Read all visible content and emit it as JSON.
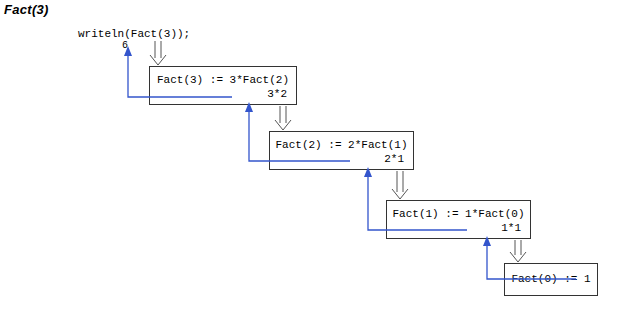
{
  "title": "Fact(3)",
  "call": {
    "statement": "writeln(Fact(3));",
    "result": "6"
  },
  "colors": {
    "return_arrow": "#3355cc",
    "call_arrow": "#555555",
    "box_border": "#333333",
    "text": "#000000",
    "background": "#ffffff"
  },
  "frames": [
    {
      "expression": "Fact(3) := 3*Fact(2)",
      "return_label": "3*2",
      "x": 149,
      "y": 66,
      "w": 148,
      "h": 39
    },
    {
      "expression": "Fact(2) := 2*Fact(1)",
      "return_label": "2*1",
      "x": 269,
      "y": 131,
      "w": 145,
      "h": 39
    },
    {
      "expression": "Fact(1) := 1*Fact(0)",
      "return_label": "1*1",
      "x": 386,
      "y": 200,
      "w": 145,
      "h": 39
    },
    {
      "expression": "Fact(0) := 1",
      "return_label": "",
      "x": 504,
      "y": 263,
      "w": 94,
      "h": 33
    }
  ],
  "call_arrows": [
    {
      "name": "call-arrow-main-to-fact3",
      "x": 158,
      "y1": 41,
      "y2": 64
    },
    {
      "name": "call-arrow-fact3-to-fact2",
      "x": 283,
      "y1": 106,
      "y2": 129
    },
    {
      "name": "call-arrow-fact2-to-fact1",
      "x": 400,
      "y1": 171,
      "y2": 198
    },
    {
      "name": "call-arrow-fact1-to-fact0",
      "x": 518,
      "y1": 240,
      "y2": 261
    }
  ],
  "return_arrows": [
    {
      "name": "return-arrow-fact3-to-main",
      "start_x": 232,
      "y": 97,
      "corner_x": 128,
      "tip_y": 51
    },
    {
      "name": "return-arrow-fact2-to-fact3",
      "start_x": 350,
      "y": 161,
      "corner_x": 249,
      "tip_y": 107
    },
    {
      "name": "return-arrow-fact1-to-fact2",
      "start_x": 467,
      "y": 230,
      "corner_x": 368,
      "tip_y": 172
    },
    {
      "name": "return-arrow-fact0-to-fact1",
      "start_x": 576,
      "y": 279,
      "corner_x": 487,
      "tip_y": 241
    }
  ]
}
